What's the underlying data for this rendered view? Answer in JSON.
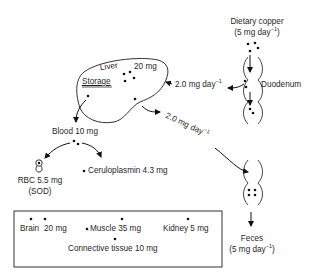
{
  "diagram": {
    "type": "copper metabolism flow",
    "dietary": {
      "title": "Dietary copper",
      "amount": "(5 mg day",
      "sup": "−1",
      "close": ")"
    },
    "duodenum": {
      "label": "Duodenum"
    },
    "liver": {
      "label": "Liver",
      "amount": "20 mg",
      "storage_label": "Storage"
    },
    "flows": {
      "duodenum_to_liver": {
        "value": "2.0 mg day",
        "sup": "−1"
      },
      "liver_to_feces": {
        "value": "2.0 mg day",
        "sup": "−1"
      }
    },
    "blood": {
      "label": "Blood 10 mg"
    },
    "rbc": {
      "line1": "RBC 5.5 mg",
      "line2": "(SOD)"
    },
    "ceruloplasmin": {
      "label": "Ceruloplasmin 4.3 mg"
    },
    "tissues": {
      "brain": "Brain",
      "brain_amount": "20 mg",
      "muscle": "Muscle 35 mg",
      "kidney": "Kidney 5 mg",
      "connective": "Connective tissue 10 mg"
    },
    "feces": {
      "title": "Feces",
      "amount": "(5 mg day",
      "sup": "−1",
      "close": ")"
    }
  }
}
